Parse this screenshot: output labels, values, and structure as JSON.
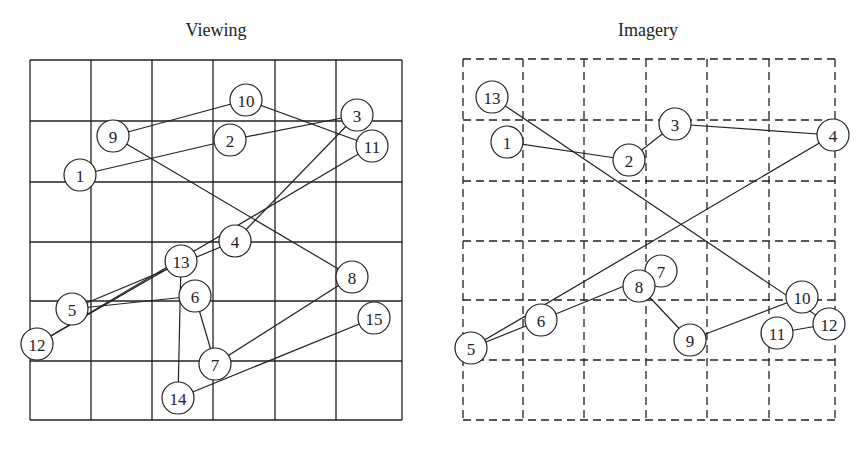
{
  "panels": [
    {
      "title": "Viewing",
      "grid_style": "solid",
      "grid": {
        "x": [
          30,
          91,
          152,
          213,
          275,
          336,
          402
        ],
        "y": [
          60,
          121,
          182,
          242,
          301,
          361,
          420
        ]
      },
      "nodes": [
        {
          "id": "1",
          "x": 80,
          "y": 175
        },
        {
          "id": "2",
          "x": 230,
          "y": 140
        },
        {
          "id": "3",
          "x": 357,
          "y": 115
        },
        {
          "id": "4",
          "x": 235,
          "y": 241
        },
        {
          "id": "5",
          "x": 72,
          "y": 309
        },
        {
          "id": "6",
          "x": 195,
          "y": 296
        },
        {
          "id": "7",
          "x": 215,
          "y": 364
        },
        {
          "id": "8",
          "x": 352,
          "y": 277
        },
        {
          "id": "9",
          "x": 113,
          "y": 136
        },
        {
          "id": "10",
          "x": 246,
          "y": 100
        },
        {
          "id": "11",
          "x": 372,
          "y": 146
        },
        {
          "id": "12",
          "x": 37,
          "y": 344
        },
        {
          "id": "13",
          "x": 181,
          "y": 261
        },
        {
          "id": "14",
          "x": 178,
          "y": 398
        },
        {
          "id": "15",
          "x": 374,
          "y": 318
        }
      ],
      "edges": [
        [
          "1",
          "2"
        ],
        [
          "2",
          "3"
        ],
        [
          "3",
          "4"
        ],
        [
          "4",
          "5"
        ],
        [
          "5",
          "6"
        ],
        [
          "6",
          "7"
        ],
        [
          "7",
          "8"
        ],
        [
          "8",
          "9"
        ],
        [
          "9",
          "10"
        ],
        [
          "10",
          "11"
        ],
        [
          "11",
          "12"
        ],
        [
          "12",
          "13"
        ],
        [
          "13",
          "14"
        ],
        [
          "14",
          "15"
        ]
      ]
    },
    {
      "title": "Imagery",
      "grid_style": "dashed",
      "grid": {
        "x": [
          463,
          523,
          584,
          646,
          707,
          769,
          835
        ],
        "y": [
          59,
          120,
          181,
          241,
          300,
          360,
          420
        ]
      },
      "nodes": [
        {
          "id": "1",
          "x": 507,
          "y": 142
        },
        {
          "id": "2",
          "x": 629,
          "y": 160
        },
        {
          "id": "3",
          "x": 675,
          "y": 124
        },
        {
          "id": "4",
          "x": 833,
          "y": 135
        },
        {
          "id": "5",
          "x": 471,
          "y": 348
        },
        {
          "id": "6",
          "x": 541,
          "y": 320
        },
        {
          "id": "7",
          "x": 661,
          "y": 271
        },
        {
          "id": "8",
          "x": 639,
          "y": 286
        },
        {
          "id": "9",
          "x": 690,
          "y": 340
        },
        {
          "id": "10",
          "x": 802,
          "y": 297
        },
        {
          "id": "11",
          "x": 777,
          "y": 333
        },
        {
          "id": "12",
          "x": 829,
          "y": 324
        },
        {
          "id": "13",
          "x": 492,
          "y": 97
        }
      ],
      "edges": [
        [
          "1",
          "2"
        ],
        [
          "2",
          "3"
        ],
        [
          "3",
          "4"
        ],
        [
          "4",
          "5"
        ],
        [
          "5",
          "6"
        ],
        [
          "6",
          "7"
        ],
        [
          "8",
          "9"
        ],
        [
          "9",
          "10"
        ],
        [
          "11",
          "12"
        ],
        [
          "12",
          "13"
        ]
      ]
    }
  ],
  "style": {
    "stroke": "#222222",
    "node_radius": 16
  }
}
